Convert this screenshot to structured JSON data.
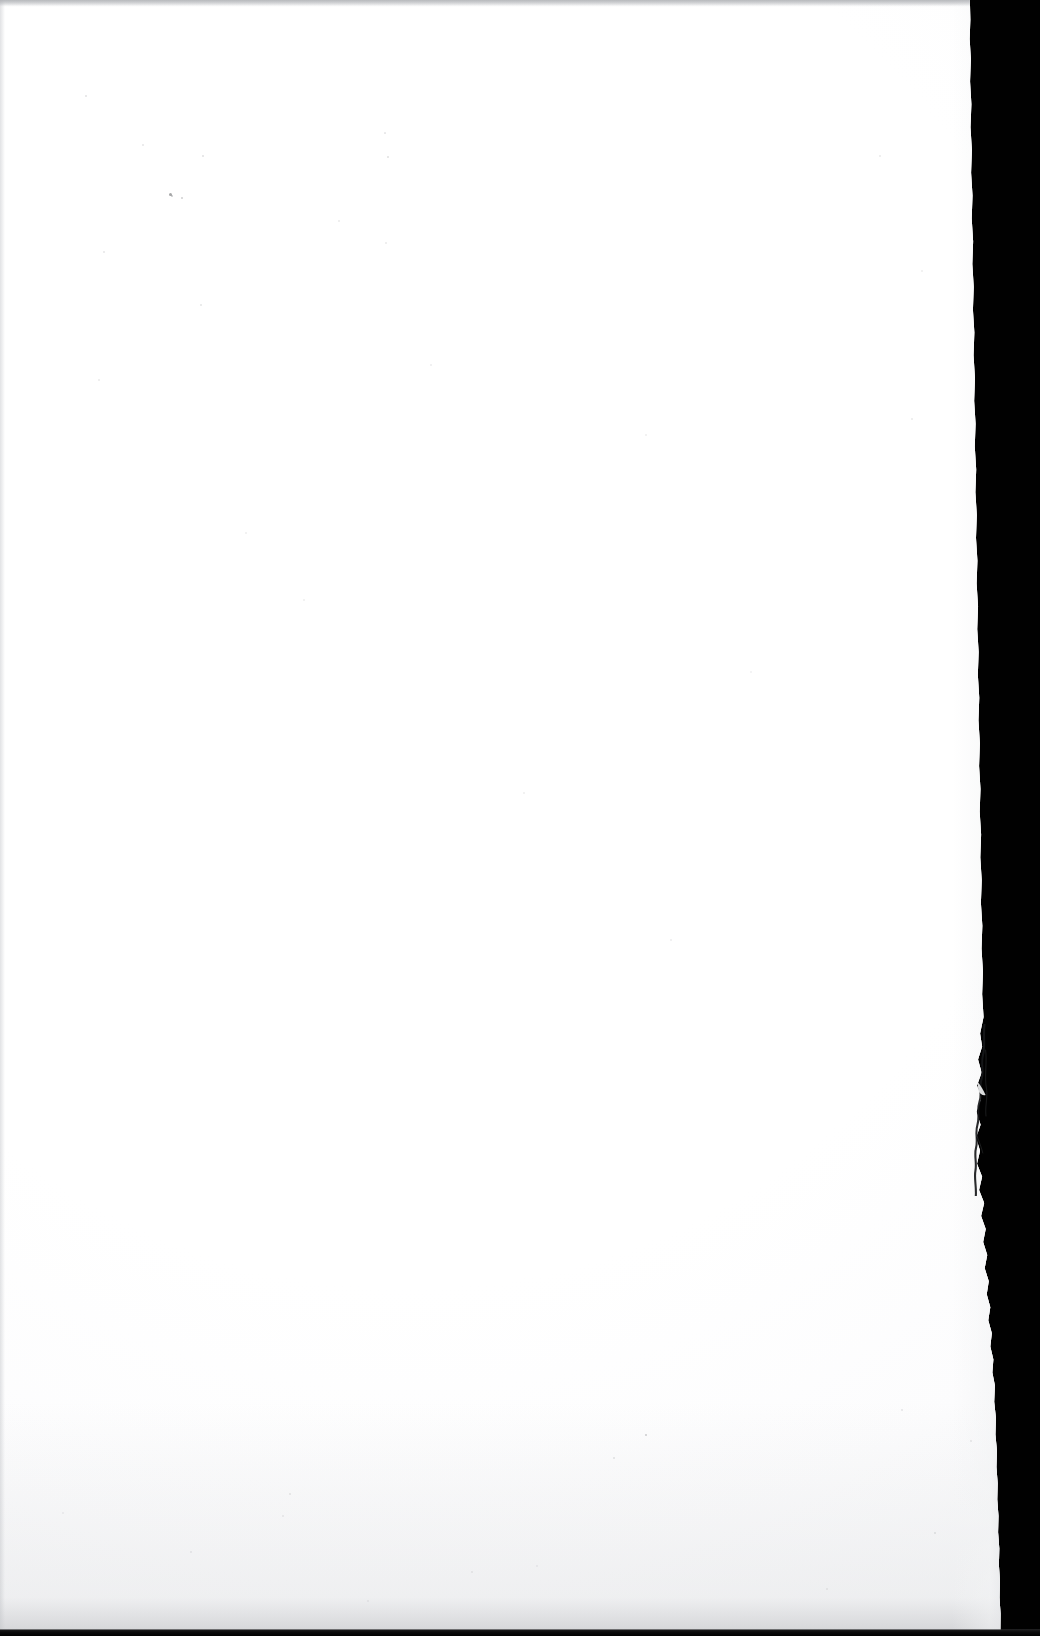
{
  "document": {
    "kind": "scanned-page",
    "page_content": "",
    "page_state_label": "blank",
    "visible_text": []
  },
  "canvas": {
    "width_px": 1040,
    "height_px": 1636
  },
  "colors": {
    "paper": "#ffffff",
    "paper_shade": "#f7f8f9",
    "scanner_background": "#010101",
    "edge_shadow": "#cdced1",
    "tear_line": "#1a1a1c",
    "top_band": "#acaeb2",
    "bottom_strip": "#0a0a0b"
  },
  "paper": {
    "label": "blank white page",
    "left_px": 0,
    "top_px": 0,
    "width_px": 1022,
    "height_px": 1630,
    "right_edge_top_px": 985,
    "right_edge_bottom_px": 1018
  },
  "scanner_background": {
    "label": "black scanner backing visible beyond the page edge",
    "band_left_px": 985,
    "band_right_px": 1040
  },
  "edge_features": {
    "right_edge": {
      "label": "ragged torn right edge",
      "description": "irregular deckled edge running the full height of the sheet"
    },
    "tear": {
      "label": "tear flap and crease",
      "top_px": 1024,
      "bottom_px": 1196,
      "left_px": 963,
      "right_px": 989
    },
    "bottom_strip": {
      "label": "dark platen strip below the sheet",
      "height_px": 7
    },
    "top_band": {
      "label": "faint grey band along the top scan border",
      "height_px": 6
    },
    "left_band": {
      "label": "faint grey line along the left scan border",
      "width_px": 3
    }
  },
  "specks": [
    {
      "x": 170,
      "y": 194,
      "size": 3.0,
      "opacity": 0.42
    },
    {
      "x": 182,
      "y": 198,
      "size": 1.6,
      "opacity": 0.2
    },
    {
      "x": 86,
      "y": 96,
      "size": 1.4,
      "opacity": 0.12
    },
    {
      "x": 143,
      "y": 145,
      "size": 1.3,
      "opacity": 0.1
    },
    {
      "x": 203,
      "y": 156,
      "size": 1.5,
      "opacity": 0.13
    },
    {
      "x": 388,
      "y": 157,
      "size": 1.8,
      "opacity": 0.14
    },
    {
      "x": 104,
      "y": 252,
      "size": 1.4,
      "opacity": 0.1
    },
    {
      "x": 201,
      "y": 305,
      "size": 1.5,
      "opacity": 0.11
    },
    {
      "x": 386,
      "y": 243,
      "size": 1.3,
      "opacity": 0.09
    },
    {
      "x": 172,
      "y": 196,
      "size": 2.0,
      "opacity": 0.25
    },
    {
      "x": 385,
      "y": 133,
      "size": 1.2,
      "opacity": 0.1
    },
    {
      "x": 339,
      "y": 221,
      "size": 1.6,
      "opacity": 0.09
    },
    {
      "x": 99,
      "y": 380,
      "size": 1.4,
      "opacity": 0.09
    },
    {
      "x": 431,
      "y": 365,
      "size": 1.4,
      "opacity": 0.08
    },
    {
      "x": 304,
      "y": 600,
      "size": 1.5,
      "opacity": 0.07
    },
    {
      "x": 524,
      "y": 793,
      "size": 1.3,
      "opacity": 0.07
    },
    {
      "x": 671,
      "y": 940,
      "size": 1.5,
      "opacity": 0.08
    },
    {
      "x": 246,
      "y": 533,
      "size": 1.3,
      "opacity": 0.07
    },
    {
      "x": 912,
      "y": 419,
      "size": 1.6,
      "opacity": 0.09
    },
    {
      "x": 880,
      "y": 156,
      "size": 1.4,
      "opacity": 0.09
    },
    {
      "x": 922,
      "y": 271,
      "size": 1.3,
      "opacity": 0.07
    },
    {
      "x": 646,
      "y": 435,
      "size": 1.4,
      "opacity": 0.07
    },
    {
      "x": 751,
      "y": 672,
      "size": 1.3,
      "opacity": 0.06
    },
    {
      "x": 646,
      "y": 1435,
      "size": 2.2,
      "opacity": 0.22
    },
    {
      "x": 614,
      "y": 1458,
      "size": 1.5,
      "opacity": 0.11
    },
    {
      "x": 902,
      "y": 1410,
      "size": 1.5,
      "opacity": 0.1
    },
    {
      "x": 935,
      "y": 1533,
      "size": 1.6,
      "opacity": 0.11
    },
    {
      "x": 290,
      "y": 1494,
      "size": 2.0,
      "opacity": 0.1
    },
    {
      "x": 283,
      "y": 1516,
      "size": 1.4,
      "opacity": 0.07
    },
    {
      "x": 191,
      "y": 1552,
      "size": 1.4,
      "opacity": 0.08
    },
    {
      "x": 472,
      "y": 1572,
      "size": 1.4,
      "opacity": 0.07
    },
    {
      "x": 537,
      "y": 1566,
      "size": 1.3,
      "opacity": 0.06
    },
    {
      "x": 971,
      "y": 1441,
      "size": 1.5,
      "opacity": 0.09
    },
    {
      "x": 827,
      "y": 1589,
      "size": 1.4,
      "opacity": 0.07
    },
    {
      "x": 63,
      "y": 1513,
      "size": 1.3,
      "opacity": 0.06
    },
    {
      "x": 368,
      "y": 1601,
      "size": 1.3,
      "opacity": 0.06
    }
  ]
}
